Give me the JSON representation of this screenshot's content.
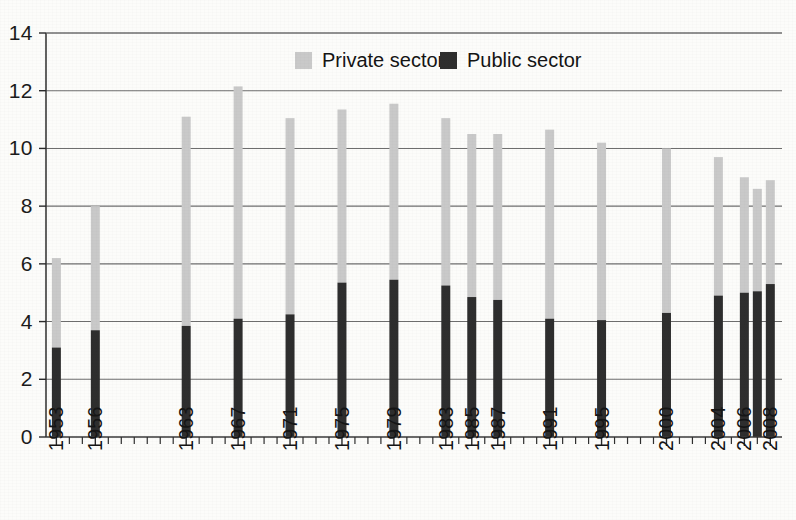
{
  "chart_data": {
    "type": "bar",
    "subtype": "stacked-column",
    "title": "",
    "subtitle": "",
    "xlabel": "",
    "ylabel": "",
    "xlim": [
      1952.2,
      2008.9
    ],
    "ylim": [
      0,
      14
    ],
    "grid": true,
    "grid_axis": "y",
    "legend_position": "top-center",
    "categories": [
      "1953",
      "1956",
      "1963",
      "1967",
      "1971",
      "1975",
      "1979",
      "1983",
      "1985",
      "1987",
      "1991",
      "1995",
      "2000",
      "2004",
      "2006",
      "2007",
      "2008"
    ],
    "x": [
      1953,
      1956,
      1963,
      1967,
      1971,
      1975,
      1979,
      1983,
      1985,
      1987,
      1991,
      1995,
      2000,
      2004,
      2006,
      2007,
      2008
    ],
    "tick_labels_x": [
      "1953",
      "1956",
      "1963",
      "1967",
      "1971",
      "1975",
      "1979",
      "1983",
      "1985",
      "1987",
      "1991",
      "1995",
      "2000",
      "2004",
      "2006",
      "2008"
    ],
    "tick_labels_y": [
      "0",
      "2",
      "4",
      "6",
      "8",
      "10",
      "12",
      "14"
    ],
    "tick_values_y": [
      0,
      2,
      4,
      6,
      8,
      10,
      12,
      14
    ],
    "series": [
      {
        "name": "Public sector",
        "color": "#2e2e2e",
        "values": [
          3.1,
          3.7,
          3.85,
          4.1,
          4.25,
          5.35,
          5.45,
          5.25,
          4.85,
          4.75,
          4.1,
          4.05,
          4.3,
          4.9,
          5.0,
          5.05,
          5.3
        ]
      },
      {
        "name": "Private sector",
        "color": "#c9c9c9",
        "values": [
          3.1,
          4.3,
          7.25,
          8.05,
          6.8,
          6.0,
          6.1,
          5.8,
          5.65,
          5.75,
          6.55,
          6.15,
          5.7,
          4.8,
          4.0,
          3.55,
          3.6
        ]
      }
    ],
    "totals": [
      6.2,
      8.0,
      11.1,
      12.15,
      11.05,
      11.35,
      11.55,
      11.05,
      10.5,
      10.5,
      10.65,
      10.2,
      10.0,
      9.7,
      9.0,
      8.6,
      8.9
    ]
  },
  "legend": {
    "items": [
      {
        "label": "Private sector",
        "swatch_color": "#c9c9c9",
        "key": "private"
      },
      {
        "label": "Public sector",
        "swatch_color": "#2e2e2e",
        "key": "public"
      }
    ]
  },
  "axes": {
    "y": {
      "labels": [
        "14",
        "12",
        "10",
        "8",
        "6",
        "4",
        "2",
        "0"
      ],
      "values": [
        14,
        12,
        10,
        8,
        6,
        4,
        2,
        0
      ]
    },
    "x": {
      "labels": [
        "1953",
        "1956",
        "1963",
        "1967",
        "1971",
        "1975",
        "1979",
        "1983",
        "1985",
        "1987",
        "1991",
        "1995",
        "2000",
        "2004",
        "2006",
        "2008"
      ],
      "values": [
        1953,
        1956,
        1963,
        1967,
        1971,
        1975,
        1979,
        1983,
        1985,
        1987,
        1991,
        1995,
        2000,
        2004,
        2006,
        2008
      ],
      "orientation": "vertical"
    }
  },
  "style": {
    "background": "#fcfcfa",
    "grid_color": "#6e6e6e",
    "axis_color": "#3a3a3a",
    "text_color": "#151515",
    "private_color": "#c9c9c9",
    "public_color": "#2e2e2e"
  }
}
